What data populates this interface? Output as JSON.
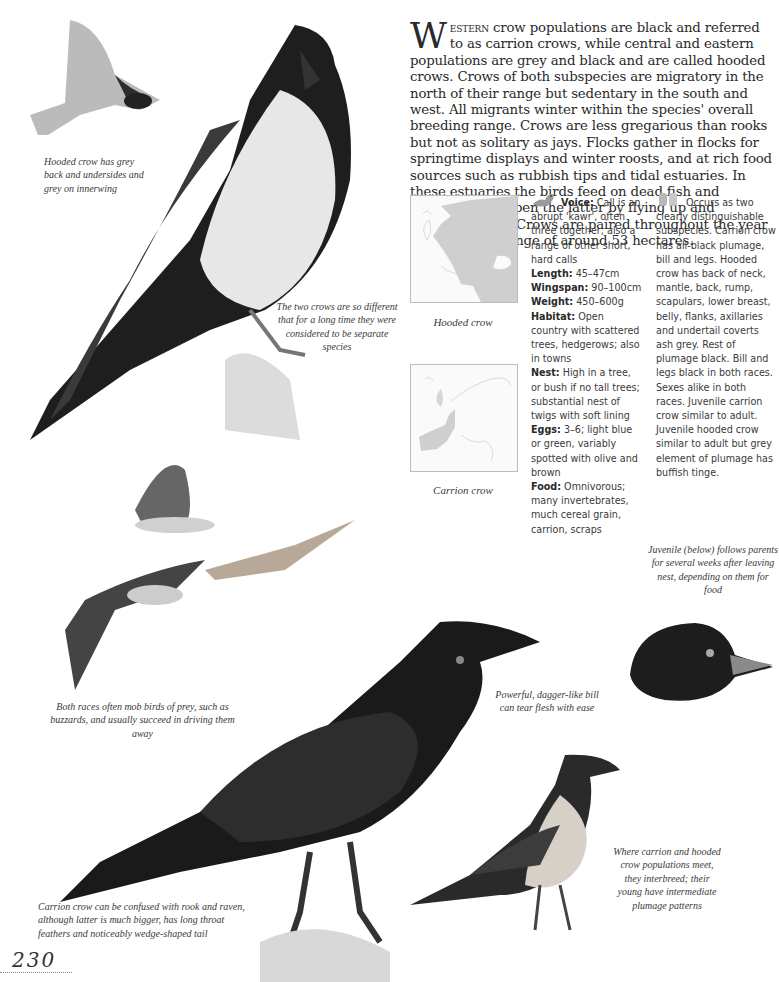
{
  "intro": {
    "dropcap": "W",
    "lead_smallcaps": "estern",
    "text": " crow populations are black and referred to as carrion crows, while central and eastern populations are grey and black and are called hooded crows. Crows of both subspecies are migratory in the north of their range but sedentary in the south and west. All migrants winter within the species' overall breeding range. Crows are less gregarious than rooks but not as solitary as jays. Flocks gather in flocks for springtime displays and winter roosts, and at rich food sources such as rubbish tips and tidal estuaries. In these estuaries the birds feed on dead fish and shellfish; they open the latter by flying up and dropping them. Crows are paired throughout the year and occupy a range of around 53 hectares."
  },
  "maps": [
    {
      "caption": "Hooded crow",
      "range": "central-eastern-europe"
    },
    {
      "caption": "Carrion crow",
      "range": "western-europe"
    }
  ],
  "facts": {
    "icon": "bird-icon",
    "items": [
      {
        "label": "Voice:",
        "value": " Call is an abrupt 'kawr', often three together; also a range of other short, hard calls"
      },
      {
        "label": "Length:",
        "value": " 45–47cm"
      },
      {
        "label": "Wingspan:",
        "value": " 90–100cm"
      },
      {
        "label": "Weight:",
        "value": " 450–600g"
      },
      {
        "label": "Habitat:",
        "value": " Open country with scattered trees, hedgerows; also in towns"
      },
      {
        "label": "Nest:",
        "value": " High in a tree, or bush if no tall trees; substantial nest of twigs with soft lining"
      },
      {
        "label": "Eggs:",
        "value": " 3–6; light blue or green, variably spotted with olive and brown"
      },
      {
        "label": "Food:",
        "value": " Omnivorous; many invertebrates, much cereal grain, carrion, scraps"
      }
    ]
  },
  "identification": {
    "icon": "binoculars-icon",
    "text": "Occurs as two clearly distinguishable subspecies. Carrion crow has all-black plumage, bill and legs. Hooded crow has back of neck, mantle, back, rump, scapulars, lower breast, belly, flanks, axillaries and undertail coverts ash grey. Rest of plumage black. Bill and legs black in both races. Sexes alike in both races. Juvenile carrion crow similar to adult. Juvenile hooded crow similar to adult but grey element of plumage has buffish tinge."
  },
  "captions": {
    "hooded_flight": "Hooded crow has grey back and undersides and grey on innerwing",
    "separate_species": "The two crows are so different that for a long time they were considered to be separate species",
    "mob_prey": "Both races often mob birds of prey, such as buzzards, and usually succeed in driving them away",
    "juvenile": "Juvenile (below) follows parents for several weeks after leaving nest, depending on them for food",
    "bill": "Powerful, dagger-like bill can tear flesh with ease",
    "confusion": "Carrion crow can be confused with rook and raven, although latter is much bigger, has long throat feathers and noticeably wedge-shaped tail",
    "hybrid": "Where carrion and hooded crow populations meet, they interbreed; their young have intermediate plumage patterns"
  },
  "page_number": "230"
}
